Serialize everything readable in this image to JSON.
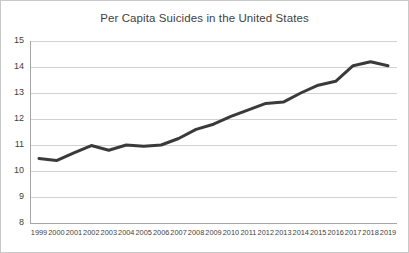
{
  "chart_data": {
    "type": "line",
    "title": "Per Capita Suicides in the United States",
    "xlabel": "",
    "ylabel": "",
    "ylim": [
      8,
      15
    ],
    "ytick_step": 1,
    "yticks": [
      "8",
      "9",
      "10",
      "11",
      "12",
      "13",
      "14",
      "15"
    ],
    "grid": true,
    "legend": false,
    "legend_position": "none",
    "categories": [
      "1999",
      "2000",
      "2001",
      "2002",
      "2003",
      "2004",
      "2005",
      "2006",
      "2007",
      "2008",
      "2009",
      "2010",
      "2011",
      "2012",
      "2013",
      "2014",
      "2015",
      "2016",
      "2017",
      "2018",
      "2019"
    ],
    "series": [
      {
        "name": "Per capita suicides",
        "values": [
          10.48,
          10.4,
          10.7,
          10.98,
          10.8,
          11.0,
          10.95,
          11.0,
          11.25,
          11.6,
          11.8,
          12.1,
          12.35,
          12.6,
          12.65,
          13.0,
          13.3,
          13.45,
          14.05,
          14.2,
          14.05
        ]
      }
    ],
    "colors": {
      "line": "#3a3a3a",
      "grid": "#d2d2d2",
      "axis": "#a6a6a6",
      "text": "#3f3f3f",
      "background": "#ffffff",
      "frame": "#c9c9c9"
    }
  }
}
